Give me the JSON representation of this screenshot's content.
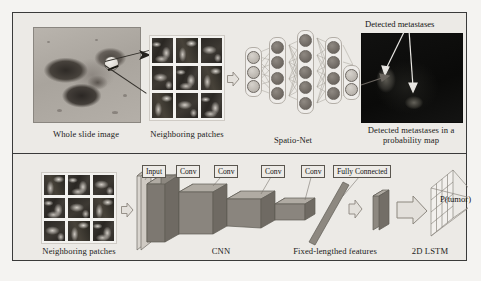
{
  "figure": {
    "panels": [
      {
        "id": "pipeline-overview",
        "labels": {
          "whole_slide_image": "Whole slide image",
          "neighboring_patches": "Neighboring patches",
          "spatio_net": "Spatio-Net",
          "detected_metastases_annotation": "Detected metastases",
          "probability_map": "Detected metastases in a\nprobability map"
        },
        "spatio_net": {
          "layers": [
            {
              "name": "input-layer",
              "nodes": 3,
              "shade": "light"
            },
            {
              "name": "hidden-layer-1",
              "nodes": 4,
              "shade": "dark"
            },
            {
              "name": "hidden-layer-2",
              "nodes": 5,
              "shade": "dark"
            },
            {
              "name": "hidden-layer-3",
              "nodes": 4,
              "shade": "dark"
            },
            {
              "name": "output-layer",
              "nodes": 2,
              "shade": "light"
            }
          ]
        },
        "patch_grid": {
          "rows": 3,
          "cols": 3
        }
      },
      {
        "id": "network-architecture",
        "labels": {
          "neighboring_patches": "Neighboring patches",
          "cnn": "CNN",
          "fixed_length_features": "Fixed-lengthed features",
          "lstm": "2D LSTM",
          "output": "P(tumor)"
        },
        "layer_tags": [
          "Input",
          "Conv",
          "Conv",
          "Conv",
          "Conv",
          "Fully Connected"
        ],
        "patch_grid": {
          "rows": 3,
          "cols": 3
        }
      }
    ]
  },
  "colors": {
    "page_background": "#f4f3f1",
    "frame_background": "#eceae6",
    "frame_border": "#3a3a3a",
    "block_fill": "#8d8880",
    "block_top": "#b0aba3",
    "block_side": "#6f6a63",
    "arrow_fill": "#e3e0db",
    "arrow_stroke": "#8c877f",
    "node_light": "#c3beb7",
    "node_dark": "#6e6862",
    "text": "#141414"
  }
}
